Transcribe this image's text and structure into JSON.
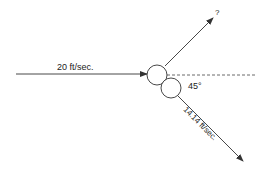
{
  "diagram": {
    "type": "vector-collision",
    "incoming": {
      "label": "20 ft/sec.",
      "speed": 20,
      "unit": "ft/sec."
    },
    "outgoing_unknown": {
      "label": "?"
    },
    "outgoing_known": {
      "label": "14.14 ft/sec.",
      "speed": 14.14,
      "unit": "ft/sec."
    },
    "angle": {
      "label": "45°",
      "value": 45
    },
    "colors": {
      "stroke": "#333333",
      "background": "#ffffff"
    }
  }
}
